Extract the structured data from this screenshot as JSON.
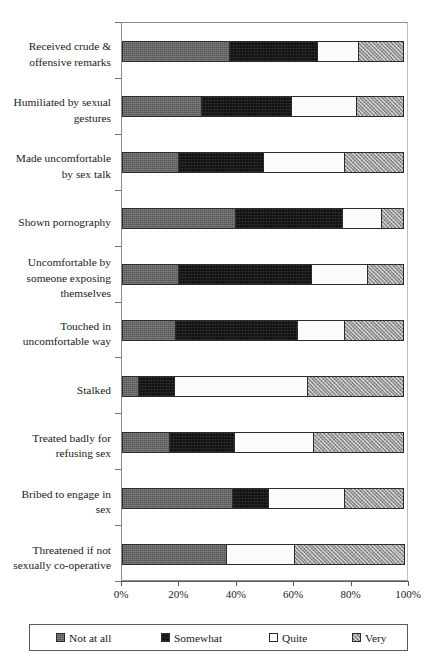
{
  "chart_data": {
    "type": "bar",
    "orientation": "horizontal",
    "stacked": true,
    "normalized": true,
    "title": "",
    "subtitle": "",
    "xlabel": "",
    "ylabel": "",
    "xlim": [
      0,
      100
    ],
    "grid": false,
    "legend_position": "bottom",
    "x_tick_labels": [
      "0%",
      "20%",
      "40%",
      "60%",
      "80%",
      "100%"
    ],
    "x_tick_values": [
      0,
      20,
      40,
      60,
      80,
      100
    ],
    "categories": [
      "Received crude & offensive remarks",
      "Humiliated by sexual gestures",
      "Made uncomfortable by sex talk",
      "Shown pornography",
      "Uncomfortable by someone exposing themselves",
      "Touched in uncomfortable way",
      "Stalked",
      "Treated badly for refusing sex",
      "Bribed to engage in sex",
      "Threatened if not sexually co-operative"
    ],
    "category_lines": [
      [
        "Received crude &",
        "offensive remarks"
      ],
      [
        "Humiliated by sexual",
        "gestures"
      ],
      [
        "Made uncomfortable",
        "by sex talk"
      ],
      [
        "Shown pornography"
      ],
      [
        "Uncomfortable by",
        "someone exposing",
        "themselves"
      ],
      [
        "Touched in",
        "uncomfortable way"
      ],
      [
        "Stalked"
      ],
      [
        "Treated badly for",
        "refusing sex"
      ],
      [
        "Bribed to engage in",
        "sex"
      ],
      [
        "Threatened if not",
        "sexually co-operative"
      ]
    ],
    "series": [
      {
        "name": "Not at all",
        "pattern": "dark-grey-dense",
        "color": "#555555",
        "values": [
          38,
          28,
          20,
          40,
          20,
          19,
          6,
          17,
          39,
          37
        ]
      },
      {
        "name": "Somewhat",
        "pattern": "black-solid",
        "color": "#121212",
        "values": [
          31,
          32,
          30,
          38,
          47,
          43,
          13,
          23,
          13,
          0
        ]
      },
      {
        "name": "Quite",
        "pattern": "white",
        "color": "#fbfbfb",
        "values": [
          15,
          23,
          29,
          14,
          20,
          17,
          47,
          28,
          27,
          24
        ]
      },
      {
        "name": "Very",
        "pattern": "grey-checker",
        "color": "#9a9a9a",
        "values": [
          16,
          17,
          21,
          8,
          13,
          21,
          34,
          32,
          21,
          39
        ]
      }
    ]
  },
  "legend": {
    "items": [
      {
        "label": "Not at all",
        "swatch": "legend-swatch-not-at-all"
      },
      {
        "label": "Somewhat",
        "swatch": "legend-swatch-somewhat"
      },
      {
        "label": "Quite",
        "swatch": "legend-swatch-quite"
      },
      {
        "label": "Very",
        "swatch": "legend-swatch-very"
      }
    ]
  }
}
